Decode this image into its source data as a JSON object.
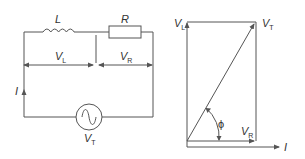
{
  "diagram": {
    "colors": {
      "line": "#555555",
      "text": "#333333",
      "background": "#ffffff"
    },
    "circuit": {
      "components": [
        {
          "id": "inductor",
          "label": "L"
        },
        {
          "id": "resistor",
          "label": "R"
        },
        {
          "id": "ac-source",
          "label_main": "V",
          "label_sub": "T"
        }
      ],
      "voltages": [
        {
          "id": "VL",
          "label_main": "V",
          "label_sub": "L"
        },
        {
          "id": "VR",
          "label_main": "V",
          "label_sub": "R"
        }
      ],
      "current": {
        "label": "I"
      }
    },
    "phasor": {
      "labels": {
        "VL": {
          "main": "V",
          "sub": "L"
        },
        "VT": {
          "main": "V",
          "sub": "T"
        },
        "VR": {
          "main": "V",
          "sub": "R"
        },
        "I": "I",
        "phi": "ϕ"
      }
    }
  }
}
